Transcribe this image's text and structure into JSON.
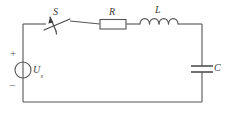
{
  "figure": {
    "name": "series-rlc-circuit-with-switch",
    "type": "electrical-schematic",
    "width": 225,
    "height": 118,
    "background_color": "#ffffff",
    "line_color": "#555555"
  },
  "labels": {
    "switch": "S",
    "resistor": "R",
    "inductor": "L",
    "capacitor": "C",
    "source_symbol": "U",
    "source_subscript": "s",
    "polarity_positive": "+",
    "polarity_negative": "−"
  },
  "components": [
    {
      "id": "voltage-source",
      "label": "Us",
      "kind": "independent-voltage-source",
      "shape": "circle-with-vertical-line",
      "position": "left-branch",
      "center": [
        23,
        70
      ],
      "radius": 8,
      "polarity_top": "+",
      "polarity_bottom": "−"
    },
    {
      "id": "switch",
      "label": "S",
      "kind": "single-pole-switch",
      "state": "open",
      "position": "top-branch",
      "span": [
        45,
        67
      ]
    },
    {
      "id": "resistor",
      "label": "R",
      "kind": "resistor",
      "shape": "rectangle",
      "position": "top-branch",
      "span": [
        100,
        126
      ]
    },
    {
      "id": "inductor",
      "label": "L",
      "kind": "inductor",
      "shape": "four-arc-coil",
      "coil_count": 4,
      "position": "top-branch",
      "span": [
        140,
        178
      ]
    },
    {
      "id": "capacitor",
      "label": "C",
      "kind": "capacitor",
      "shape": "two-parallel-plates",
      "position": "right-branch",
      "plate_y": [
        66,
        72
      ]
    }
  ],
  "loop": {
    "left_x": 23,
    "right_x": 202,
    "top_y": 24,
    "bottom_y": 102
  }
}
